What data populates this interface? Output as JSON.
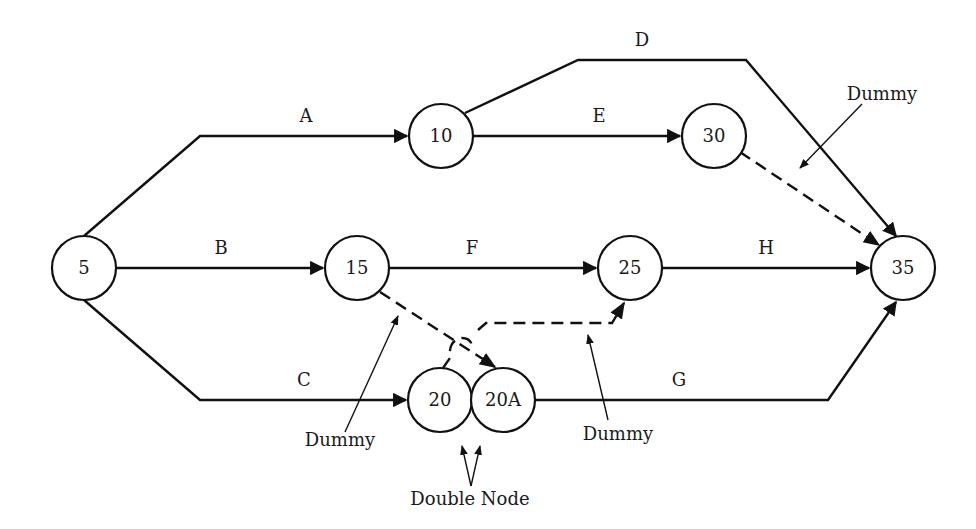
{
  "diagram": {
    "type": "activity-on-arrow network",
    "nodes": [
      {
        "id": "5",
        "label": "5"
      },
      {
        "id": "10",
        "label": "10"
      },
      {
        "id": "15",
        "label": "15"
      },
      {
        "id": "20",
        "label": "20"
      },
      {
        "id": "20A",
        "label": "20A"
      },
      {
        "id": "25",
        "label": "25"
      },
      {
        "id": "30",
        "label": "30"
      },
      {
        "id": "35",
        "label": "35"
      }
    ],
    "activities": [
      {
        "label": "A",
        "from": "5",
        "to": "10"
      },
      {
        "label": "B",
        "from": "5",
        "to": "15"
      },
      {
        "label": "C",
        "from": "5",
        "to": "20"
      },
      {
        "label": "D",
        "from": "10",
        "to": "35"
      },
      {
        "label": "E",
        "from": "10",
        "to": "30"
      },
      {
        "label": "F",
        "from": "15",
        "to": "25"
      },
      {
        "label": "G",
        "from": "20A",
        "to": "35"
      },
      {
        "label": "H",
        "from": "25",
        "to": "35"
      }
    ],
    "dummies": [
      {
        "from": "30",
        "to": "35"
      },
      {
        "from": "15",
        "to": "20A"
      },
      {
        "from": "20",
        "to": "25"
      }
    ],
    "annotations": {
      "dummy_top": "Dummy",
      "dummy_left": "Dummy",
      "dummy_right": "Dummy",
      "double_node": "Double Node"
    }
  }
}
